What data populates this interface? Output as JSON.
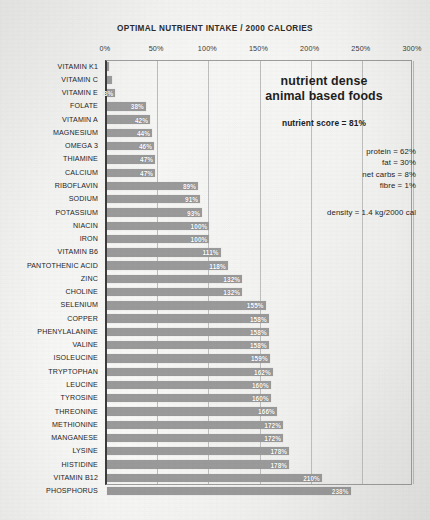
{
  "chart_data": {
    "type": "bar",
    "orientation": "horizontal",
    "title": "OPTIMAL NUTRIENT INTAKE / 2000 CALORIES",
    "xlabel": "",
    "ylabel": "",
    "xlim": [
      0,
      300
    ],
    "grid": true,
    "gridline_values": [
      0,
      50,
      100,
      150,
      200,
      250,
      300
    ],
    "tick_labels": [
      "0%",
      "50%",
      "100%",
      "150%",
      "200%",
      "250%",
      "300%"
    ],
    "value_suffix": "%",
    "legend": null,
    "bar_color": "#9a9a9a",
    "categories": [
      "VITAMIN K1",
      "VITAMIN C",
      "VITAMIN E",
      "FOLATE",
      "VITAMIN A",
      "MAGNESIUM",
      "OMEGA 3",
      "THIAMINE",
      "CALCIUM",
      "RIBOFLAVIN",
      "SODIUM",
      "POTASSIUM",
      "NIACIN",
      "IRON",
      "VITAMIN B6",
      "PANTOTHENIC ACID",
      "ZINC",
      "CHOLINE",
      "SELENIUM",
      "COPPER",
      "PHENYLALANINE",
      "VALINE",
      "ISOLEUCINE",
      "TRYPTOPHAN",
      "LEUCINE",
      "TYROSINE",
      "THREONINE",
      "METHIONINE",
      "MANGANESE",
      "LYSINE",
      "HISTIDINE",
      "VITAMIN B12",
      "PHOSPHORUS"
    ],
    "values": [
      2,
      5,
      8,
      38,
      42,
      44,
      46,
      47,
      47,
      89,
      91,
      93,
      100,
      100,
      111,
      118,
      132,
      132,
      155,
      158,
      158,
      158,
      159,
      162,
      160,
      160,
      166,
      172,
      172,
      178,
      178,
      210,
      238
    ],
    "value_labels": [
      "",
      "",
      "8%",
      "38%",
      "42%",
      "44%",
      "46%",
      "47%",
      "47%",
      "89%",
      "91%",
      "93%",
      "100%",
      "100%",
      "111%",
      "118%",
      "132%",
      "132%",
      "155%",
      "158%",
      "158%",
      "158%",
      "159%",
      "162%",
      "160%",
      "160%",
      "166%",
      "172%",
      "172%",
      "178%",
      "178%",
      "210%",
      "238%"
    ]
  },
  "panel": {
    "headline_line1": "nutrient dense",
    "headline_line2": "animal based foods",
    "score": "nutrient score = 81%",
    "macros": [
      "protein = 62%",
      "fat = 30%",
      "net carbs = 8%",
      "fibre = 1%"
    ],
    "density": "density = 1.4 kg/2000 cal"
  }
}
